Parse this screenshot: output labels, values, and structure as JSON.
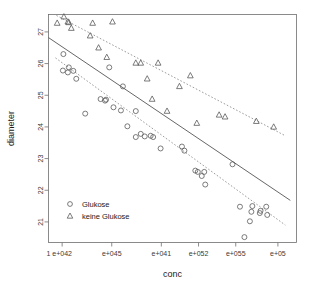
{
  "figure": {
    "kind": "r-base-scatterplot",
    "width": 315,
    "height": 293,
    "background": "#ffffff"
  },
  "chart_data": {
    "type": "scatter",
    "title": "",
    "subtitle": "",
    "xlabel": "conc",
    "ylabel": "diameter",
    "grid": false,
    "legend_position": "bottom-left",
    "xlim": [
      0,
      1
    ],
    "ylim": [
      20.35,
      27.55
    ],
    "x_is_log_like": true,
    "x_tick_labels": [
      "1",
      "e+042",
      "e+045",
      "e+041",
      "e+052",
      "e+055",
      "e+05"
    ],
    "x_tick_positions": [
      0.0,
      0.055,
      0.255,
      0.455,
      0.605,
      0.755,
      0.925
    ],
    "x_tick_mark_positions": [
      0.055,
      0.255,
      0.455,
      0.605,
      0.755,
      0.925
    ],
    "y_tick_labels": [
      "27",
      "26",
      "25",
      "24",
      "23",
      "22",
      "21"
    ],
    "y_tick_values": [
      27,
      26,
      25,
      24,
      23,
      22,
      21
    ],
    "marker_styles": {
      "Glukose": "circle",
      "keine Glukose": "triangle"
    },
    "legend": [
      {
        "label": "Glukose",
        "marker": "circle"
      },
      {
        "label": "keine Glukose",
        "marker": "triangle"
      }
    ],
    "series": [
      {
        "name": "Glukose",
        "marker": "circle",
        "points": [
          {
            "x": 0.06,
            "y": 26.3
          },
          {
            "x": 0.058,
            "y": 25.78
          },
          {
            "x": 0.078,
            "y": 25.72
          },
          {
            "x": 0.082,
            "y": 25.88
          },
          {
            "x": 0.1,
            "y": 25.77
          },
          {
            "x": 0.112,
            "y": 25.52
          },
          {
            "x": 0.148,
            "y": 24.42
          },
          {
            "x": 0.245,
            "y": 25.88
          },
          {
            "x": 0.21,
            "y": 24.88
          },
          {
            "x": 0.228,
            "y": 24.83
          },
          {
            "x": 0.232,
            "y": 24.86
          },
          {
            "x": 0.262,
            "y": 24.62
          },
          {
            "x": 0.3,
            "y": 25.28
          },
          {
            "x": 0.292,
            "y": 24.52
          },
          {
            "x": 0.318,
            "y": 24.02
          },
          {
            "x": 0.352,
            "y": 24.5
          },
          {
            "x": 0.352,
            "y": 23.68
          },
          {
            "x": 0.372,
            "y": 23.78
          },
          {
            "x": 0.388,
            "y": 23.7
          },
          {
            "x": 0.412,
            "y": 23.72
          },
          {
            "x": 0.422,
            "y": 23.68
          },
          {
            "x": 0.452,
            "y": 23.32
          },
          {
            "x": 0.538,
            "y": 23.38
          },
          {
            "x": 0.548,
            "y": 23.25
          },
          {
            "x": 0.602,
            "y": 22.58
          },
          {
            "x": 0.592,
            "y": 22.62
          },
          {
            "x": 0.628,
            "y": 22.58
          },
          {
            "x": 0.618,
            "y": 22.45
          },
          {
            "x": 0.632,
            "y": 22.18
          },
          {
            "x": 0.742,
            "y": 22.82
          },
          {
            "x": 0.772,
            "y": 21.48
          },
          {
            "x": 0.822,
            "y": 21.5
          },
          {
            "x": 0.818,
            "y": 21.32
          },
          {
            "x": 0.855,
            "y": 21.35
          },
          {
            "x": 0.852,
            "y": 21.28
          },
          {
            "x": 0.878,
            "y": 21.48
          },
          {
            "x": 0.812,
            "y": 21.02
          },
          {
            "x": 0.882,
            "y": 21.22
          },
          {
            "x": 0.79,
            "y": 20.52
          }
        ],
        "fit_line": {
          "style": "dashed",
          "x0": 0.028,
          "y0": 26.18,
          "x1": 0.955,
          "y1": 20.9
        }
      },
      {
        "name": "keine Glukose",
        "marker": "triangle",
        "points": [
          {
            "x": 0.035,
            "y": 27.28
          },
          {
            "x": 0.062,
            "y": 27.48
          },
          {
            "x": 0.078,
            "y": 27.32
          },
          {
            "x": 0.082,
            "y": 27.3
          },
          {
            "x": 0.092,
            "y": 27.12
          },
          {
            "x": 0.178,
            "y": 27.28
          },
          {
            "x": 0.258,
            "y": 27.32
          },
          {
            "x": 0.168,
            "y": 26.88
          },
          {
            "x": 0.202,
            "y": 26.5
          },
          {
            "x": 0.235,
            "y": 26.2
          },
          {
            "x": 0.352,
            "y": 26.02
          },
          {
            "x": 0.372,
            "y": 26.02
          },
          {
            "x": 0.442,
            "y": 26.02
          },
          {
            "x": 0.398,
            "y": 25.52
          },
          {
            "x": 0.418,
            "y": 24.88
          },
          {
            "x": 0.478,
            "y": 24.5
          },
          {
            "x": 0.528,
            "y": 25.28
          },
          {
            "x": 0.572,
            "y": 25.62
          },
          {
            "x": 0.598,
            "y": 24.12
          },
          {
            "x": 0.688,
            "y": 24.38
          },
          {
            "x": 0.712,
            "y": 24.32
          },
          {
            "x": 0.838,
            "y": 24.18
          },
          {
            "x": 0.908,
            "y": 24.0
          }
        ],
        "fit_line": {
          "style": "dashed",
          "x0": 0.032,
          "y0": 27.52,
          "x1": 0.955,
          "y1": 23.72
        }
      }
    ],
    "overall_fit_line": {
      "name": "overall regression",
      "style": "solid",
      "x0": 0.0,
      "y0": 26.82,
      "x1": 0.975,
      "y1": 21.68
    }
  }
}
